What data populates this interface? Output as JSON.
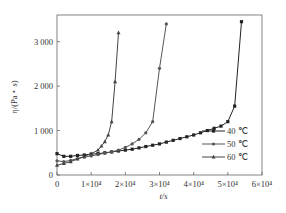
{
  "chart_data": {
    "type": "line",
    "title": "",
    "xlabel": "t/s",
    "ylabel": "η/(Pa・s)",
    "xlim": [
      0,
      60000
    ],
    "ylim": [
      0,
      3600
    ],
    "xticks": [
      0,
      10000,
      20000,
      30000,
      40000,
      50000,
      60000
    ],
    "xtick_labels": [
      "0",
      "1×10⁴",
      "2×10⁴",
      "3×10⁴",
      "4×10⁴",
      "5×10⁴",
      "6×10⁴"
    ],
    "yticks": [
      0,
      1000,
      2000,
      3000
    ],
    "ytick_labels": [
      "0",
      "1 000",
      "2 000",
      "3 000"
    ],
    "grid": false,
    "legend_position": "lower right",
    "series": [
      {
        "name": "40 ℃",
        "marker": "square",
        "x": [
          0,
          2000,
          4000,
          6000,
          8000,
          10000,
          12000,
          14000,
          16000,
          18000,
          20000,
          22000,
          24000,
          26000,
          28000,
          30000,
          32000,
          34000,
          36000,
          38000,
          40000,
          42000,
          44000,
          46000,
          48000,
          50000,
          52000,
          54000
        ],
        "y": [
          480,
          420,
          420,
          440,
          450,
          470,
          480,
          500,
          520,
          540,
          560,
          580,
          610,
          640,
          670,
          700,
          740,
          780,
          820,
          860,
          900,
          950,
          1000,
          1050,
          1100,
          1200,
          1550,
          3450
        ]
      },
      {
        "name": "50 ℃",
        "marker": "circle",
        "x": [
          0,
          2000,
          4000,
          6000,
          8000,
          10000,
          12000,
          14000,
          16000,
          18000,
          20000,
          22000,
          24000,
          26000,
          28000,
          30000,
          32000
        ],
        "y": [
          320,
          300,
          330,
          370,
          400,
          430,
          460,
          490,
          520,
          560,
          620,
          700,
          800,
          950,
          1200,
          2400,
          3400
        ]
      },
      {
        "name": "60 ℃",
        "marker": "triangle",
        "x": [
          0,
          2000,
          4000,
          6000,
          8000,
          10000,
          12000,
          13000,
          14000,
          15000,
          16000,
          17000,
          18000
        ],
        "y": [
          220,
          260,
          300,
          360,
          420,
          480,
          560,
          650,
          750,
          900,
          1200,
          2100,
          3200
        ]
      }
    ]
  }
}
